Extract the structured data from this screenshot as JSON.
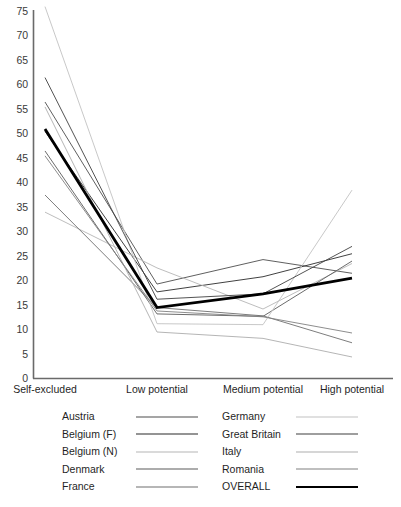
{
  "chart_data": {
    "type": "line",
    "title": "",
    "subtitle": "",
    "xlabel": "",
    "ylabel": "",
    "categories": [
      "Self-excluded",
      "Low potential",
      "Medium potential",
      "High potential"
    ],
    "ylim": [
      0,
      75
    ],
    "ytick_step": 5,
    "yticks": [
      0,
      5,
      10,
      15,
      20,
      25,
      30,
      35,
      40,
      45,
      50,
      55,
      60,
      65,
      70,
      75
    ],
    "grid": false,
    "legend_position": "bottom",
    "series": [
      {
        "name": "Austria",
        "values": [
          56.5,
          19.3,
          24.3,
          21.5
        ],
        "color": "#4d4d4d",
        "width": 0.9
      },
      {
        "name": "Belgium (F)",
        "values": [
          50.5,
          17.7,
          20.8,
          25.5
        ],
        "color": "#2b2b2b",
        "width": 0.9
      },
      {
        "name": "Belgium (N)",
        "values": [
          34.0,
          22.6,
          14.2,
          23.5
        ],
        "color": "#b5b5b5",
        "width": 0.9
      },
      {
        "name": "Denmark",
        "values": [
          46.5,
          13.2,
          12.7,
          24.0
        ],
        "color": "#5a5a5a",
        "width": 0.9
      },
      {
        "name": "France",
        "values": [
          37.5,
          14.5,
          12.8,
          7.3
        ],
        "color": "#6e6e6e",
        "width": 0.9
      },
      {
        "name": "Germany",
        "values": [
          76.0,
          11.2,
          11.0,
          38.5
        ],
        "color": "#c2c2c2",
        "width": 0.9
      },
      {
        "name": "Great Britain",
        "values": [
          61.5,
          16.2,
          17.3,
          27.0
        ],
        "color": "#3f3f3f",
        "width": 0.9
      },
      {
        "name": "Italy",
        "values": [
          55.5,
          9.5,
          8.2,
          4.4
        ],
        "color": "#adadad",
        "width": 0.9
      },
      {
        "name": "Romania",
        "values": [
          45.5,
          13.8,
          12.6,
          9.3
        ],
        "color": "#808080",
        "width": 0.9
      },
      {
        "name": "OVERALL",
        "values": [
          51.0,
          14.5,
          17.3,
          20.5
        ],
        "color": "#000000",
        "width": 2.8
      }
    ]
  },
  "legend": {
    "columns": [
      {
        "entries": [
          "Austria",
          "Belgium (F)",
          "Belgium (N)",
          "Denmark",
          "France"
        ]
      },
      {
        "entries": [
          "Germany",
          "Great Britain",
          "Italy",
          "Romania",
          "OVERALL"
        ]
      }
    ]
  },
  "axis": {
    "y_axis_name": "y-axis",
    "x_axis_name": "x-axis"
  }
}
